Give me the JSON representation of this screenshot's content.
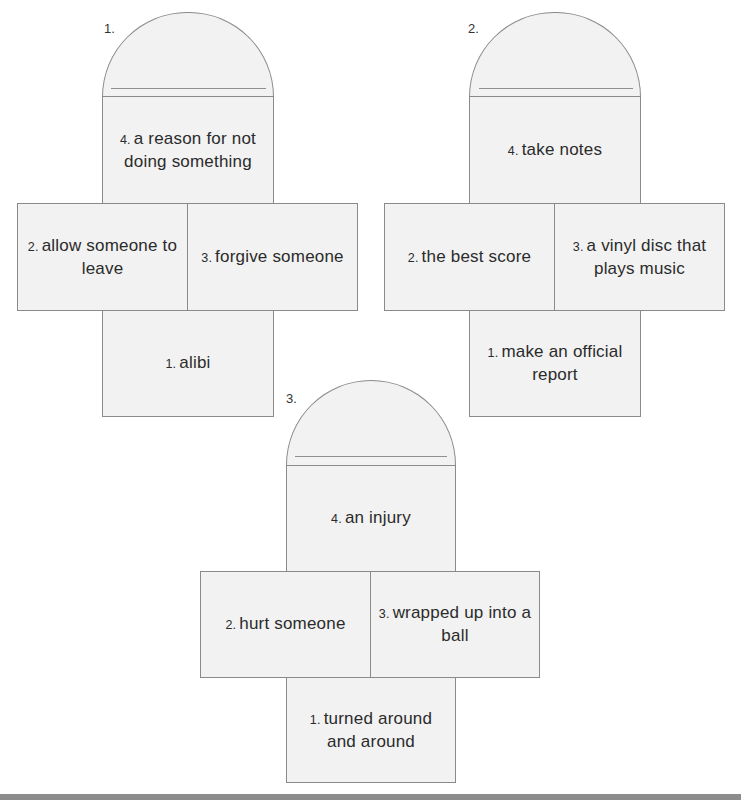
{
  "figures": [
    {
      "label": "1.",
      "top": {
        "num": "4.",
        "text": "a reason for not doing something"
      },
      "left": {
        "num": "2.",
        "text": "allow someone to leave"
      },
      "right": {
        "num": "3.",
        "text": "forgive someone"
      },
      "bottom": {
        "num": "1.",
        "text": "alibi"
      }
    },
    {
      "label": "2.",
      "top": {
        "num": "4.",
        "text": "take notes"
      },
      "left": {
        "num": "2.",
        "text": "the best score"
      },
      "right": {
        "num": "3.",
        "text": "a vinyl disc that plays music"
      },
      "bottom": {
        "num": "1.",
        "text": "make an official report"
      }
    },
    {
      "label": "3.",
      "top": {
        "num": "4.",
        "text": "an injury"
      },
      "left": {
        "num": "2.",
        "text": "hurt someone"
      },
      "right": {
        "num": "3.",
        "text": "wrapped up into a ball"
      },
      "bottom": {
        "num": "1.",
        "text": "turned around and around"
      }
    }
  ],
  "colors": {
    "panel_fill": "#f2f2f2",
    "border": "#8a8a8a",
    "footer_bar": "#8c8c8c"
  }
}
